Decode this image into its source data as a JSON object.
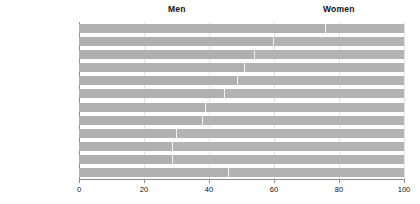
{
  "header": {
    "men_label": "Men",
    "women_label": "Women"
  },
  "axis": {
    "ticks": [
      {
        "value": 0,
        "label": "0"
      },
      {
        "value": 20,
        "label": "20"
      },
      {
        "value": 40,
        "label": "40"
      },
      {
        "value": 60,
        "label": "60"
      },
      {
        "value": 80,
        "label": "80"
      },
      {
        "value": 100,
        "label": "100"
      }
    ]
  },
  "colors": {
    "bar_men": "#b0b0b0",
    "bar_women": "#b3b3b3",
    "divider": "#f2f2f2",
    "gridline": "#e3e3e3",
    "axis": "#8c8c8c",
    "text": "#111111",
    "background": "#ffffff"
  },
  "rows": [
    {
      "label": "Physics",
      "men": 76,
      "women": 24
    },
    {
      "label": "Mathematics",
      "men": 60,
      "women": 40
    },
    {
      "label": "Geography",
      "men": 54,
      "women": 46
    },
    {
      "label": "Chemistry",
      "men": 51,
      "women": 49
    },
    {
      "label": "General studies",
      "men": 49,
      "women": 51
    },
    {
      "label": "History",
      "men": 45,
      "women": 55
    },
    {
      "label": "English",
      "men": 39,
      "women": 61
    },
    {
      "label": "Biological sciences",
      "men": 38,
      "women": 62
    },
    {
      "label": "Modern languages",
      "men": 30,
      "women": 70
    },
    {
      "label": "Social studies",
      "men": 29,
      "women": 71
    },
    {
      "label": "English literature",
      "men": 29,
      "women": 71
    },
    {
      "label": "All",
      "men": 46,
      "women": 54
    }
  ],
  "chart_data": {
    "type": "bar",
    "orientation": "horizontal",
    "stacked": true,
    "normalized_percent": true,
    "title": "",
    "subtitle": "",
    "xlabel": "",
    "ylabel": "",
    "xlim": [
      0,
      100
    ],
    "grid": true,
    "grid_axis": "x",
    "legend": "top",
    "legend_entries": [
      "Men",
      "Women"
    ],
    "categories": [
      "Physics",
      "Mathematics",
      "Geography",
      "Chemistry",
      "General studies",
      "History",
      "English",
      "Biological sciences",
      "Modern languages",
      "Social studies",
      "English literature",
      "All"
    ],
    "series": [
      {
        "name": "Men",
        "values": [
          76,
          60,
          54,
          51,
          49,
          45,
          39,
          38,
          30,
          29,
          29,
          46
        ]
      },
      {
        "name": "Women",
        "values": [
          24,
          40,
          46,
          49,
          51,
          55,
          61,
          62,
          70,
          71,
          71,
          54
        ]
      }
    ],
    "xticks": [
      0,
      20,
      40,
      60,
      80,
      100
    ],
    "xticklabels": [
      "0",
      "20",
      "40",
      "60",
      "80",
      "100"
    ]
  }
}
